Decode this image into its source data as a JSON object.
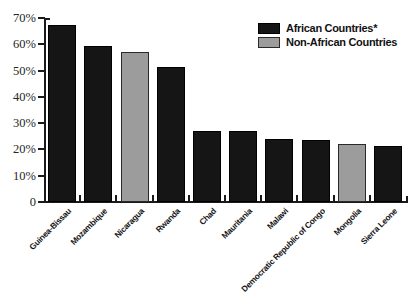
{
  "chart_data": {
    "type": "bar",
    "title": "",
    "subtitle": "",
    "xlabel": "",
    "ylabel": "",
    "ylim": [
      0,
      70
    ],
    "grid": false,
    "legend_position": "top-right",
    "ytick_labels": [
      "70%",
      "60%",
      "50%",
      "40%",
      "30%",
      "20%",
      "10%",
      "0"
    ],
    "ytick_values": [
      70,
      60,
      50,
      40,
      30,
      20,
      10,
      0
    ],
    "categories": [
      "Guinea-Bissau",
      "Mozambique",
      "Nicaragua",
      "Rwanda",
      "Chad",
      "Mauritania",
      "Malawi",
      "Democratic Republic of Congo",
      "Mongolia",
      "Sierra Leone"
    ],
    "values": [
      67.5,
      59.5,
      57,
      51.5,
      27,
      27,
      24,
      23.5,
      22,
      21.5
    ],
    "groups": [
      "African Countries*",
      "African Countries*",
      "Non-African Countries",
      "African Countries*",
      "African Countries*",
      "African Countries*",
      "African Countries*",
      "African Countries*",
      "Non-African Countries",
      "African Countries*"
    ],
    "series": [
      {
        "name": "African Countries*",
        "color": "#151515",
        "values": [
          67.5,
          59.5,
          null,
          51.5,
          27,
          27,
          24,
          23.5,
          null,
          21.5
        ]
      },
      {
        "name": "Non-African Countries",
        "color": "#9c9c9c",
        "values": [
          null,
          null,
          57,
          null,
          null,
          null,
          null,
          null,
          22,
          null
        ]
      }
    ]
  },
  "legend": {
    "items": [
      {
        "label": "African Countries*",
        "color": "#151515"
      },
      {
        "label": "Non-African Countries",
        "color": "#9c9c9c"
      }
    ]
  },
  "colors": {
    "african": "#151515",
    "non_african": "#9c9c9c",
    "axis": "#1a1a1a",
    "background": "#ffffff"
  }
}
